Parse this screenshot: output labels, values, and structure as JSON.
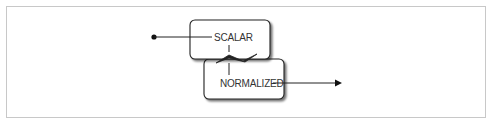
{
  "diagram": {
    "nodes": [
      {
        "id": "scalar",
        "label": "SCALAR"
      },
      {
        "id": "normalized",
        "label": "NORMALIZED"
      }
    ],
    "edges": [
      {
        "from": "start-point",
        "to": "scalar",
        "style": "line-with-dot-origin"
      },
      {
        "from": "scalar",
        "to": "normalized",
        "style": "break-zigzag"
      },
      {
        "from": "normalized",
        "to": "end",
        "style": "arrow"
      }
    ],
    "colors": {
      "stroke": "#222222",
      "frame_border": "#c8c8c8",
      "box_fill": "#ffffff",
      "shadow": "#9a9a9a"
    }
  }
}
